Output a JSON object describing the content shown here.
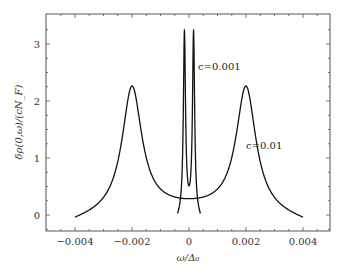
{
  "chart_data": {
    "type": "line",
    "title": "",
    "xlabel": "ω/Δ₀",
    "ylabel": "δρ(0,ω)/(cN_F)",
    "xlim": [
      -0.0048,
      0.0048
    ],
    "ylim": [
      -0.25,
      3.5
    ],
    "x_ticks": [
      -0.004,
      -0.002,
      0,
      0.002,
      0.004
    ],
    "x_tick_labels": [
      "−0.004",
      "−0.002",
      "0",
      "0.002",
      "0.004"
    ],
    "y_ticks": [
      0,
      1,
      2,
      3
    ],
    "y_tick_labels": [
      "0",
      "1",
      "2",
      "3"
    ],
    "grid": false,
    "legend": null,
    "annotations": [
      {
        "text": "c=0.001",
        "x": 0.0004,
        "y": 2.55
      },
      {
        "text": "c=0.01",
        "x": 0.0026,
        "y": 1.05
      }
    ],
    "series": [
      {
        "name": "c=0.01",
        "x": [
          -0.004,
          -0.0035,
          -0.003,
          -0.0025,
          -0.0022,
          -0.002,
          -0.0018,
          -0.0015,
          -0.001,
          -0.0005,
          0,
          0.0005,
          0.001,
          0.0015,
          0.0018,
          0.002,
          0.0022,
          0.0025,
          0.003,
          0.0035,
          0.004
        ],
        "y": [
          -0.08,
          0.1,
          0.42,
          1.2,
          1.95,
          2.28,
          1.95,
          1.2,
          0.5,
          0.22,
          0.14,
          0.22,
          0.5,
          1.2,
          1.95,
          2.28,
          1.95,
          1.2,
          0.42,
          0.1,
          -0.08
        ]
      },
      {
        "name": "c=0.001",
        "x": [
          -0.0004,
          -0.0003,
          -0.00022,
          -0.00018,
          -0.00016,
          -0.00014,
          -0.0001,
          -5e-05,
          0,
          5e-05,
          0.0001,
          0.00014,
          0.00016,
          0.00018,
          0.00022,
          0.0003,
          0.0004
        ],
        "y": [
          -0.12,
          0.3,
          1.4,
          2.6,
          3.17,
          2.6,
          1.0,
          0.2,
          0.1,
          0.2,
          1.0,
          2.6,
          3.17,
          2.6,
          1.4,
          0.3,
          -0.12
        ]
      }
    ]
  }
}
